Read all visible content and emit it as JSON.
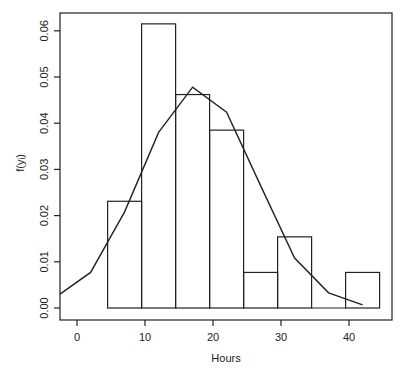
{
  "chart_data": {
    "type": "bar",
    "subtype": "histogram-with-density-line",
    "title": "",
    "xlabel": "Hours",
    "ylabel": "f(y_i)",
    "ylabel_display": "f(yᵢ)",
    "xlim": [
      -2.5,
      46
    ],
    "ylim": [
      -0.0025,
      0.0635
    ],
    "x_ticks": [
      0,
      10,
      20,
      30,
      40
    ],
    "x_tick_labels": [
      "0",
      "10",
      "20",
      "30",
      "40"
    ],
    "y_ticks": [
      0.0,
      0.01,
      0.02,
      0.03,
      0.04,
      0.05,
      0.06
    ],
    "y_tick_labels": [
      "0.00",
      "0.01",
      "0.02",
      "0.03",
      "0.04",
      "0.05",
      "0.06"
    ],
    "grid": false,
    "legend": null,
    "histogram": {
      "bin_edges": [
        4.5,
        9.5,
        14.5,
        19.5,
        24.5,
        29.5,
        34.5,
        39.5,
        44.5
      ],
      "densities": [
        0.0231,
        0.0615,
        0.0462,
        0.0385,
        0.0077,
        0.0154,
        0.0,
        0.0077
      ]
    },
    "density_line": {
      "x": [
        -2.5,
        2,
        7,
        12,
        17,
        22,
        27,
        32,
        37,
        42
      ],
      "y": [
        0.003,
        0.0077,
        0.0208,
        0.038,
        0.0478,
        0.0424,
        0.0265,
        0.0108,
        0.0033,
        0.0007
      ]
    }
  }
}
